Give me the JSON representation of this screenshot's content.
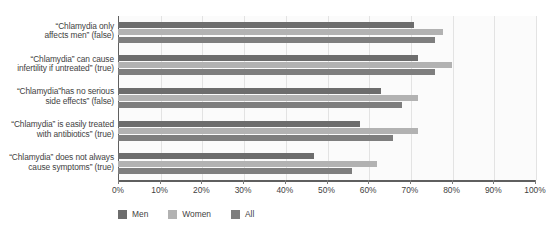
{
  "chart_data": {
    "type": "bar",
    "orientation": "horizontal",
    "title": "",
    "xlabel": "",
    "ylabel": "",
    "xlim": [
      0,
      100
    ],
    "xticks": [
      "0%",
      "10%",
      "20%",
      "30%",
      "40%",
      "50%",
      "60%",
      "70%",
      "80%",
      "90%",
      "100%"
    ],
    "xtick_values": [
      0,
      10,
      20,
      30,
      40,
      50,
      60,
      70,
      80,
      90,
      100
    ],
    "grid": true,
    "legend_position": "bottom",
    "categories": [
      "“Chlamydia only affects men” (false)",
      "“Chlamydia” can cause infertility if untreated” (true)",
      "“Chlamydia”has no serious side effects” (false)",
      "“Chlamydia” is easily treated with antibiotics” (true)",
      "“Chlamydia” does not always cause symptoms” (true)"
    ],
    "category_lines": [
      [
        "“Chlamydia only",
        "affects men” (false)"
      ],
      [
        "“Chlamydia” can cause",
        "infertility if untreated” (true)"
      ],
      [
        "“Chlamydia”has no serious",
        "side effects” (false)"
      ],
      [
        "“Chlamydia” is easily treated",
        "with antibiotics” (true)"
      ],
      [
        "“Chlamydia” does not always",
        "cause symptoms” (true)"
      ]
    ],
    "series": [
      {
        "name": "Men",
        "color": "#6d6d6d",
        "values": [
          71,
          72,
          63,
          58,
          47
        ]
      },
      {
        "name": "Women",
        "color": "#b2b2b2",
        "values": [
          78,
          80,
          72,
          72,
          62
        ]
      },
      {
        "name": "All",
        "color": "#7e7e7e",
        "values": [
          76,
          76,
          68,
          66,
          56
        ]
      }
    ]
  },
  "legend": {
    "items": [
      {
        "label": "Men",
        "color": "#6d6d6d"
      },
      {
        "label": "Women",
        "color": "#b2b2b2"
      },
      {
        "label": "All",
        "color": "#7e7e7e"
      }
    ]
  }
}
